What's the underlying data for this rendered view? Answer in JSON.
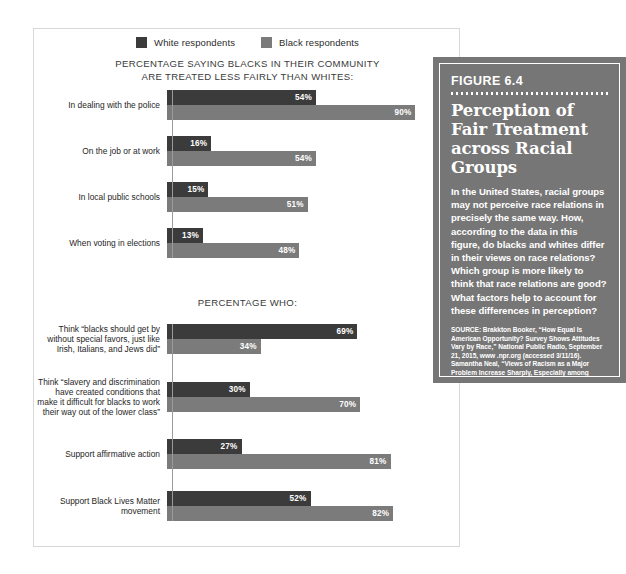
{
  "legend": {
    "items": [
      {
        "label": "White respondents",
        "series": "white",
        "color": "#3b3b3b"
      },
      {
        "label": "Black respondents",
        "series": "black",
        "color": "#7b7b7b"
      }
    ]
  },
  "figure": {
    "number": "FIGURE 6.4",
    "title": "Perception of Fair Treatment across Racial Groups",
    "body": "In the United States, racial groups may not perceive race relations in precisely the same way. How, according to the data in this figure, do blacks and whites differ in their views on race relations? Which group is more likely to think that race relations are good? What factors help to account for these differences in perception?",
    "source_label": "SOURCE:",
    "source_text": "Brakkton Booker, “How Equal Is American Opportunity? Survey Shows Attitudes Vary by Race,” National Public Radio, September 21, 2015, www .npr.org (accessed 3/11/16). Samantha Neal, “Views of Racism as a Major Problem Increase Sharply, Especially among Democrats,” Pew Research Center, August 29, 2017, www.pewresearch.org (accessed 5/23/18).",
    "background_color": "#767676"
  },
  "chart_data": {
    "type": "bar",
    "orientation": "horizontal",
    "title": "Perception of Fair Treatment across Racial Groups",
    "xlabel": "",
    "ylabel": "",
    "xlim": [
      0,
      100
    ],
    "grid": false,
    "legend_position": "top-center",
    "value_suffix": "%",
    "series_names": [
      "White respondents",
      "Black respondents"
    ],
    "series_colors": [
      "#3b3b3b",
      "#7b7b7b"
    ],
    "sections": [
      {
        "heading": "PERCENTAGE SAYING BLACKS IN THEIR COMMUNITY ARE TREATED LESS FAIRLY THAN WHITES:",
        "categories": [
          "In dealing with the police",
          "On the job or at work",
          "In local public schools",
          "When voting in elections"
        ],
        "series": [
          {
            "name": "White respondents",
            "values": [
              54,
              16,
              15,
              13
            ]
          },
          {
            "name": "Black respondents",
            "values": [
              90,
              54,
              51,
              48
            ]
          }
        ],
        "labels": [
          "54%",
          "16%",
          "15%",
          "13%",
          "90%",
          "54%",
          "51%",
          "48%"
        ]
      },
      {
        "heading": "PERCENTAGE WHO:",
        "categories": [
          "Think “blacks should get by without special favors, just like Irish, Italians, and Jews did”",
          "Think “slavery and discrimination have created conditions that make it difficult for blacks to work their way out of the lower class”",
          "Support affirmative action",
          "Support Black Lives Matter movement"
        ],
        "series": [
          {
            "name": "White respondents",
            "values": [
              69,
              30,
              27,
              52
            ]
          },
          {
            "name": "Black respondents",
            "values": [
              34,
              70,
              81,
              82
            ]
          }
        ],
        "labels": [
          "69%",
          "30%",
          "27%",
          "52%",
          "34%",
          "70%",
          "81%",
          "82%"
        ]
      }
    ]
  },
  "sections": [
    {
      "heading_line_1": "PERCENTAGE SAYING BLACKS IN THEIR COMMUNITY",
      "heading_line_2": "ARE TREATED LESS FAIRLY THAN WHITES:",
      "rows": [
        {
          "label": "In dealing with the police",
          "white": 54,
          "black": 90,
          "white_text": "54%",
          "black_text": "90%"
        },
        {
          "label": "On the job or at work",
          "white": 16,
          "black": 54,
          "white_text": "16%",
          "black_text": "54%"
        },
        {
          "label": "In local public schools",
          "white": 15,
          "black": 51,
          "white_text": "15%",
          "black_text": "51%"
        },
        {
          "label": "When voting in elections",
          "white": 13,
          "black": 48,
          "white_text": "13%",
          "black_text": "48%"
        }
      ]
    },
    {
      "heading_line_1": "PERCENTAGE WHO:",
      "heading_line_2": "",
      "rows": [
        {
          "label": "Think “blacks should get by without special favors, just like Irish, Italians, and Jews did”",
          "white": 69,
          "black": 34,
          "white_text": "69%",
          "black_text": "34%"
        },
        {
          "label": "Think “slavery and discrimination have created conditions that make it difficult for blacks to work their way out of the lower class”",
          "white": 30,
          "black": 70,
          "white_text": "30%",
          "black_text": "70%"
        },
        {
          "label": "Support affirmative action",
          "white": 27,
          "black": 81,
          "white_text": "27%",
          "black_text": "81%"
        },
        {
          "label": "Support Black Lives Matter movement",
          "white": 52,
          "black": 82,
          "white_text": "52%",
          "black_text": "82%"
        }
      ]
    }
  ]
}
